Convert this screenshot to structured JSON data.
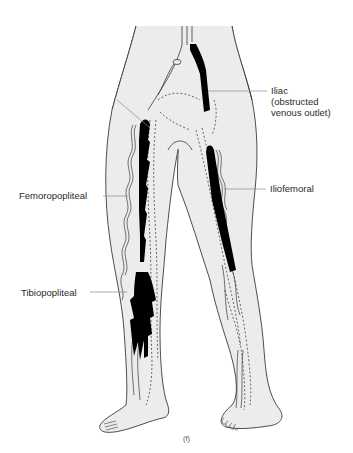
{
  "figure": {
    "panel_label": "(f)",
    "labels": {
      "iliac": {
        "line1": "Iliac",
        "line2": "(obstructed",
        "line3": "venous outlet)"
      },
      "iliofemoral": "Iliofemoral",
      "femoropopliteal": "Femoropopliteal",
      "tibiopopliteal": "Tibiopopliteal"
    },
    "colors": {
      "background": "#ffffff",
      "leg_fill": "#ececec",
      "outline": "#3a3a3a",
      "thrombus": "#000000",
      "leader_line": "#8a8a8a"
    }
  }
}
